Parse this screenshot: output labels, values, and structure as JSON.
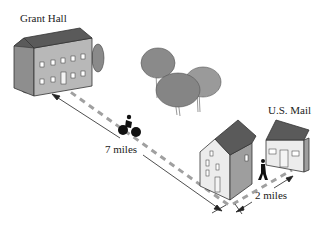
{
  "labels": {
    "grant_hall": "Grant Hall",
    "post_office": "U.S. Mail",
    "distance_long": "7 miles",
    "distance_short": "2 miles"
  },
  "colors": {
    "roof": "#5a5a5a",
    "wall_front": "#b8b8b8",
    "wall_side": "#8e8e8e",
    "road_dash": "#9a9a9a",
    "tree": "#8a8a8a",
    "line": "#222222"
  }
}
